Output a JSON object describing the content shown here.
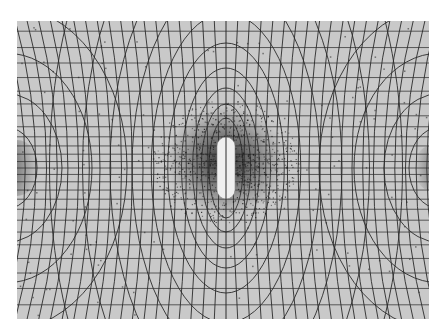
{
  "figure": {
    "colors": {
      "background": "#ffffff",
      "plate": "#c9c9c9",
      "lines": "#2a2a2a",
      "grid": "#3a3a3a",
      "filings": "#1a1a1a",
      "object": "#efefef"
    },
    "center": {
      "x": 209,
      "y": 147
    },
    "object": {
      "width": 18,
      "height": 62
    }
  }
}
